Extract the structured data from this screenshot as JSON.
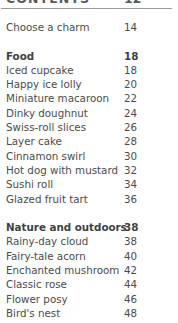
{
  "header": {
    "title": "CONTENTS",
    "page": "12"
  },
  "divider": {
    "color": "#9a9a9a"
  },
  "colors": {
    "text": "#4b4b4b",
    "heading": "#3f3f3f",
    "background": "#ffffff"
  },
  "toc": {
    "groups": [
      {
        "name": "intro",
        "heading": null,
        "entries": [
          {
            "label": "Choose a charm",
            "page": "14"
          }
        ]
      },
      {
        "name": "food",
        "heading": {
          "label": "Food",
          "page": "18"
        },
        "entries": [
          {
            "label": "Iced cupcake",
            "page": "18"
          },
          {
            "label": "Happy ice lolly",
            "page": "20"
          },
          {
            "label": "Miniature macaroon",
            "page": "22"
          },
          {
            "label": "Dinky doughnut",
            "page": "24"
          },
          {
            "label": "Swiss-roll slices",
            "page": "26"
          },
          {
            "label": "Layer cake",
            "page": "28"
          },
          {
            "label": "Cinnamon swirl",
            "page": "30"
          },
          {
            "label": "Hot dog with mustard",
            "page": "32"
          },
          {
            "label": "Sushi roll",
            "page": "34"
          },
          {
            "label": "Glazed fruit tart",
            "page": "36"
          }
        ]
      },
      {
        "name": "nature-and-outdoors",
        "heading": {
          "label": "Nature and outdoors",
          "page": "38"
        },
        "entries": [
          {
            "label": "Rainy-day cloud",
            "page": "38"
          },
          {
            "label": "Fairy-tale acorn",
            "page": "40"
          },
          {
            "label": "Enchanted mushroom",
            "page": "42"
          },
          {
            "label": "Classic rose",
            "page": "44"
          },
          {
            "label": "Flower posy",
            "page": "46"
          },
          {
            "label": "Bird's nest",
            "page": "48"
          }
        ]
      }
    ]
  }
}
